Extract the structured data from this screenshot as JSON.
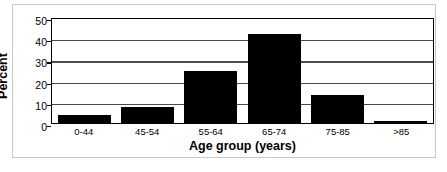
{
  "chart_data": {
    "type": "bar",
    "title": "",
    "xlabel": "Age group (years)",
    "ylabel": "Percent",
    "categories": [
      "0-44",
      "45-54",
      "55-64",
      "65-74",
      "75-85",
      ">85"
    ],
    "values": [
      3.8,
      7.5,
      25.0,
      43.0,
      13.7,
      1.0
    ],
    "ylim": [
      0,
      50
    ],
    "yticks": [
      "0",
      "10",
      "20",
      "30",
      "40",
      "50"
    ],
    "ytick_values": [
      0,
      10,
      20,
      30,
      40,
      50
    ],
    "grid": "horizontal",
    "legend": "none",
    "bar_color": "#000000",
    "axis_color": "#000000",
    "gridline_color": "#4a4a4a",
    "frame_color": "#c8c8c8"
  }
}
